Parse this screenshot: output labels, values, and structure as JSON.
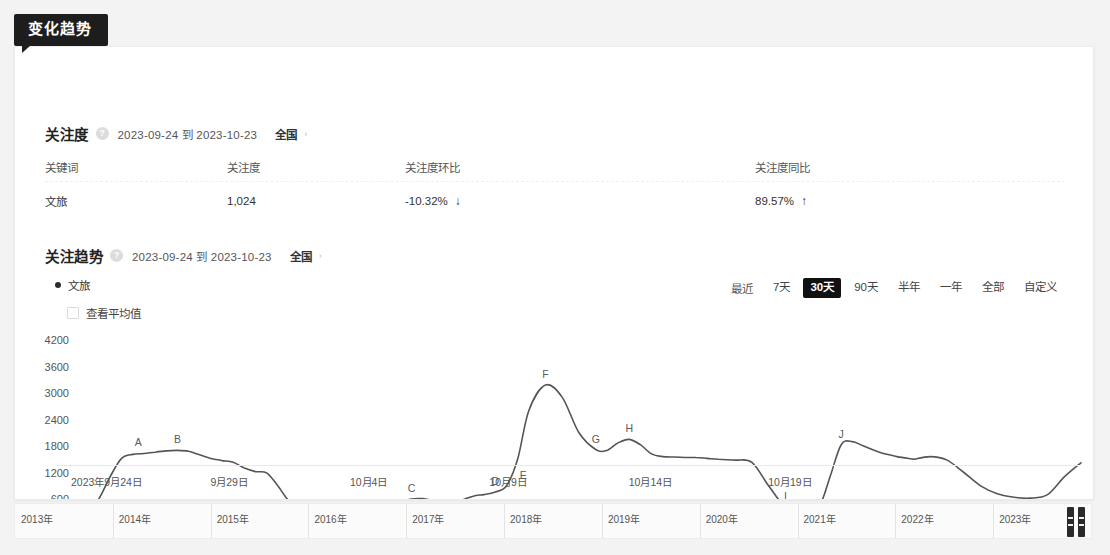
{
  "badge": {
    "label": "变化趋势"
  },
  "section1": {
    "title": "关注度",
    "help_icon": "question-mark-icon",
    "date_range": "2023-09-24 到 2023-10-23",
    "region": "全国",
    "chevron": "›",
    "table": {
      "headers": [
        "关键词",
        "关注度",
        "关注度环比",
        "关注度同比"
      ],
      "rows": [
        {
          "keyword": "文旅",
          "attention": "1,024",
          "mom": "-10.32%",
          "mom_arrow": "↓",
          "yoy": "89.57%",
          "yoy_arrow": "↑"
        }
      ]
    }
  },
  "section2": {
    "title": "关注趋势",
    "help_icon": "question-mark-icon",
    "date_range": "2023-09-24 到 2023-10-23",
    "region": "全国",
    "chevron": "›",
    "legend": {
      "name": "文旅"
    },
    "average_toggle": {
      "label": "查看平均值",
      "checked": false
    },
    "ranges": {
      "label": "最近",
      "options": [
        "7天",
        "30天",
        "90天",
        "半年",
        "一年",
        "全部",
        "自定义"
      ],
      "active": "30天"
    }
  },
  "timeline": {
    "years": [
      "2013年",
      "2014年",
      "2015年",
      "2016年",
      "2017年",
      "2018年",
      "2019年",
      "2020年",
      "2021年",
      "2022年",
      "2023年"
    ],
    "handle": "range-drag-handle"
  },
  "chart_data": {
    "type": "line",
    "title": "关注趋势",
    "xlabel": "",
    "ylabel": "",
    "grid": false,
    "legend_position": "top-left",
    "line_color": "#555555",
    "yticks": [
      600,
      1200,
      1800,
      2400,
      3000,
      3600,
      4200
    ],
    "ylim": [
      0,
      4500
    ],
    "xtick_labels": [
      "2023年9月24日",
      "9月29日",
      "10月4日",
      "10月9日",
      "10月14日",
      "10月19日"
    ],
    "xtick_positions": [
      0,
      5,
      10,
      15,
      20,
      25
    ],
    "xlim": [
      0,
      30
    ],
    "series": [
      {
        "name": "文旅",
        "x": [
          0,
          0.4,
          0.8,
          1.2,
          1.6,
          2.0,
          2.4,
          2.8,
          3.2,
          3.6,
          4.0,
          4.4,
          4.8,
          5.2,
          5.6,
          6.0,
          6.4,
          6.8,
          7.2,
          7.6,
          8.0,
          8.5,
          9.0,
          9.5,
          10.0,
          10.5,
          11.0,
          11.5,
          12.0,
          12.4,
          12.8,
          13.1,
          13.4,
          13.7,
          14.0,
          14.3,
          14.6,
          15.0,
          15.4,
          15.8,
          16.2,
          16.8,
          17.4,
          18.0,
          18.6,
          19.0,
          19.4,
          19.8,
          20.2,
          20.6,
          21.0,
          21.4,
          21.8,
          22.2,
          22.6,
          23.0,
          23.6,
          24.2,
          24.8,
          25.4,
          26.0,
          26.6,
          27.0,
          27.4,
          27.8,
          28.2,
          28.8,
          29.4,
          30.0
        ],
        "y": [
          250,
          330,
          620,
          1120,
          1520,
          1610,
          1630,
          1660,
          1690,
          1700,
          1680,
          1600,
          1520,
          1470,
          1430,
          1300,
          1220,
          1190,
          900,
          560,
          470,
          460,
          490,
          500,
          470,
          450,
          460,
          520,
          600,
          610,
          560,
          520,
          530,
          560,
          620,
          680,
          700,
          760,
          900,
          1500,
          2600,
          3180,
          2900,
          2100,
          1720,
          1700,
          1870,
          1950,
          1830,
          1620,
          1560,
          1550,
          1540,
          1540,
          1520,
          1500,
          1480,
          1430,
          900,
          430,
          420,
          440,
          1100,
          1830,
          1900,
          1800,
          1650,
          1560,
          1500
        ],
        "labeled_points": [
          {
            "label": "A",
            "x": 2.2,
            "y": 1640
          },
          {
            "label": "B",
            "x": 3.6,
            "y": 1700
          },
          {
            "label": "C",
            "x": 12.0,
            "y": 600
          },
          {
            "label": "D",
            "x": 15.0,
            "y": 760
          },
          {
            "label": "E",
            "x": 16.0,
            "y": 900
          },
          {
            "label": "F",
            "x": 16.8,
            "y": 3180
          },
          {
            "label": "G",
            "x": 18.6,
            "y": 1720
          },
          {
            "label": "H",
            "x": 19.8,
            "y": 1950
          },
          {
            "label": "I",
            "x": 25.4,
            "y": 430
          },
          {
            "label": "J",
            "x": 27.4,
            "y": 1830
          }
        ]
      },
      {
        "name": "文旅-tail",
        "x": [
          30.0,
          30.6,
          31.2,
          31.8,
          32.4,
          33.0,
          33.6,
          34.2,
          34.8,
          35.4,
          36.0
        ],
        "y": [
          1500,
          1560,
          1480,
          1200,
          900,
          720,
          640,
          620,
          700,
          1100,
          1420
        ]
      }
    ]
  }
}
